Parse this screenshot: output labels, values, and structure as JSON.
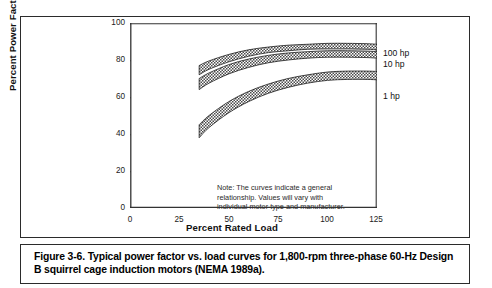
{
  "figure": {
    "caption": "Figure 3-6.  Typical power factor vs. load curves for 1,800-rpm three-phase 60-Hz Design B squirrel cage induction motors (NEMA 1989a)."
  },
  "chart_data": {
    "type": "line",
    "title": "",
    "xlabel": "Percent Rated Load",
    "ylabel": "Percent Power Factor",
    "xlim": [
      0,
      125
    ],
    "ylim": [
      0,
      100
    ],
    "xticks": [
      "0",
      "25",
      "50",
      "75",
      "100",
      "125"
    ],
    "yticks": [
      "0",
      "20",
      "40",
      "60",
      "80",
      "100"
    ],
    "grid": false,
    "legend_position": "right-of-axes-inline",
    "band_style": "hatched/shaded band between an upper and lower bound curve",
    "x": [
      35,
      40,
      50,
      60,
      70,
      80,
      90,
      100,
      110,
      120,
      125
    ],
    "series": [
      {
        "name": "100 hp",
        "label": "100 hp",
        "upper": [
          77,
          79.5,
          83,
          85.5,
          87,
          88,
          88.5,
          89,
          89,
          88.8,
          88.5
        ],
        "lower": [
          72,
          75,
          79,
          82,
          84,
          85,
          85.8,
          86,
          86,
          85.8,
          85.5
        ],
        "values": [
          74.5,
          77,
          81,
          83.8,
          85.5,
          86.5,
          87.2,
          87.5,
          87.5,
          87.3,
          87
        ]
      },
      {
        "name": "10 hp",
        "label": "10 hp",
        "upper": [
          70,
          73,
          77.5,
          80.5,
          82.5,
          83.8,
          84.5,
          85,
          85,
          84.8,
          84.5
        ],
        "lower": [
          64,
          67.5,
          72.5,
          76,
          78.5,
          80,
          81,
          81.5,
          81.5,
          81.3,
          81
        ],
        "values": [
          67,
          70.2,
          75,
          78.2,
          80.5,
          81.9,
          82.7,
          83.2,
          83.2,
          83,
          82.7
        ]
      },
      {
        "name": "1 hp",
        "label": "1 hp",
        "upper": [
          45,
          50,
          57.5,
          63,
          67,
          70,
          72,
          73.5,
          74,
          74,
          73.8
        ],
        "lower": [
          38,
          43.5,
          51.5,
          57.5,
          62,
          65.2,
          67.5,
          69,
          69.5,
          69.5,
          69.3
        ],
        "values": [
          41.5,
          46.8,
          54.5,
          60.3,
          64.5,
          67.6,
          69.8,
          71.3,
          71.8,
          71.8,
          71.6
        ]
      }
    ],
    "annotations": [
      "Note:  The curves indicate a general",
      "relationship.  Values will vary with",
      "individual motor type and manufacturer."
    ]
  },
  "note": {
    "line1": "Note:  The curves indicate a general",
    "line2": "relationship.  Values will vary with",
    "line3": "individual motor type and manufacturer."
  },
  "colors": {
    "frame": "#2b2b2b",
    "axis": "#333333",
    "band_fill": "#6e6e6e",
    "band_edge": "#1a1a1a",
    "text": "#111111"
  }
}
